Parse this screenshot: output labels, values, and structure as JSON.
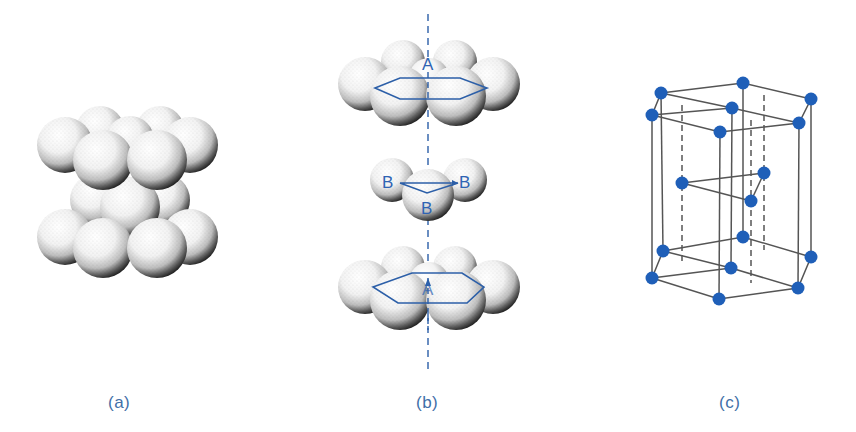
{
  "figure": {
    "panels": [
      {
        "id": "a",
        "caption": "(a)",
        "description": "Hexagonal close-packed stacking of spheres"
      },
      {
        "id": "b",
        "caption": "(b)",
        "description": "Exploded view of ABA layer stacking",
        "layer_labels": {
          "top": "A",
          "middle_left": "B",
          "middle_right": "B",
          "middle_bottom": "B",
          "bottom": "A"
        }
      },
      {
        "id": "c",
        "caption": "(c)",
        "description": "HCP unit cell with atom positions"
      }
    ],
    "colors": {
      "atom_blue": "#1f5fb8",
      "outline_blue": "#2c5fa8",
      "caption_blue": "#3f6fa8",
      "sphere_shadow": "#1a1a1a",
      "cell_line": "#555555"
    }
  }
}
